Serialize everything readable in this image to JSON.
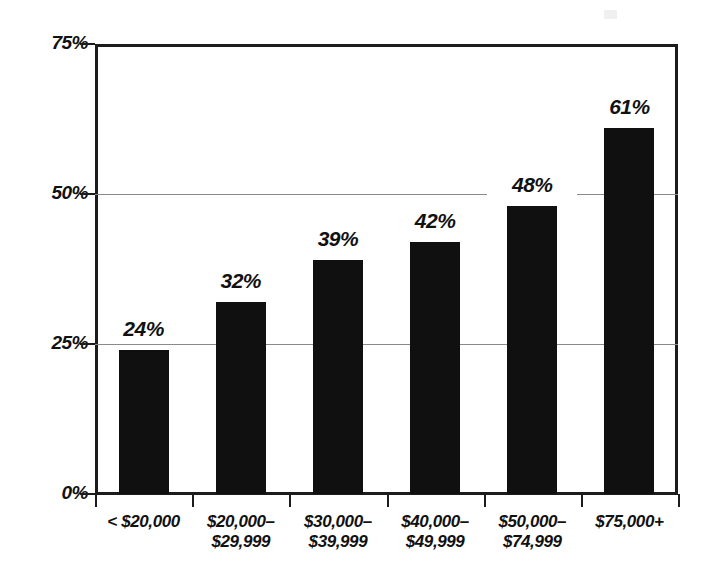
{
  "chart_data": {
    "type": "bar",
    "title": "",
    "subtitle": "",
    "xlabel": "",
    "ylabel": "",
    "categories": [
      "< $20,000",
      "$20,000–\n$29,999",
      "$30,000–\n$39,999",
      "$40,000–\n$49,999",
      "$50,000–\n$74,999",
      "$75,000+"
    ],
    "values": [
      24,
      32,
      39,
      42,
      48,
      61
    ],
    "value_labels": [
      "24%",
      "32%",
      "39%",
      "42%",
      "48%",
      "61%"
    ],
    "ylim": [
      0,
      75
    ],
    "yticks": [
      0,
      25,
      50,
      75
    ],
    "ytick_labels": [
      "0%",
      "25%",
      "50%",
      "75%"
    ],
    "grid": true,
    "gridlines_at": [
      25,
      50
    ],
    "legend": null,
    "legend_position": "none",
    "bar_color": "#101010",
    "axis_color": "#1c1c1c",
    "gridline_color": "#8a8a8a",
    "background_color": "#ffffff"
  }
}
